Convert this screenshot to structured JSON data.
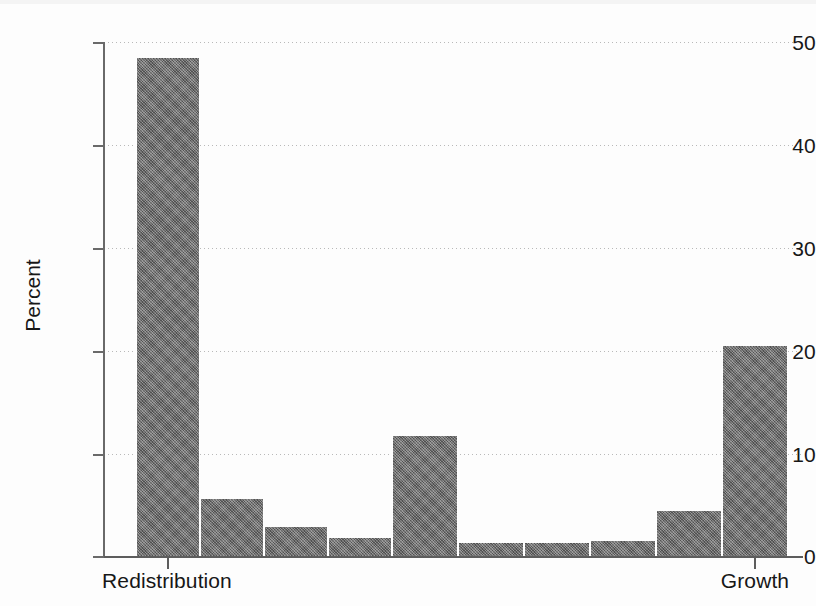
{
  "chart_data": {
    "type": "bar",
    "title": "",
    "subtitle": "",
    "xlabel": "",
    "ylabel": "Percent",
    "ylim": [
      0,
      50
    ],
    "yticks": [
      0,
      10,
      20,
      30,
      40,
      50
    ],
    "ytick_labels": [
      "0",
      "10",
      "20",
      "30",
      "40",
      "50"
    ],
    "grid": true,
    "legend": null,
    "categories": [
      "1",
      "2",
      "3",
      "4",
      "5",
      "6",
      "7",
      "8",
      "9",
      "10"
    ],
    "xtick_labels": [
      "Redistribution",
      "Growth"
    ],
    "xtick_categories": [
      "1",
      "10"
    ],
    "values": [
      48.4,
      5.5,
      2.8,
      1.75,
      11.7,
      1.3,
      1.3,
      1.5,
      4.4,
      20.4
    ],
    "bar_color": "#6e6e6e",
    "axis_color": "#5d5d5d",
    "gridline_color": "#b9b9b9",
    "background_color": "#fdfdfd"
  },
  "axis": {
    "y_title": "Percent",
    "x_left_label": "Redistribution",
    "x_right_label": "Growth"
  },
  "caption": {
    "text": ""
  }
}
